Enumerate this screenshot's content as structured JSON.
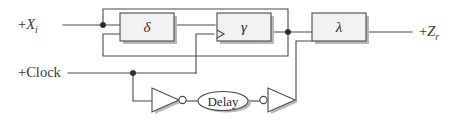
{
  "diagram": {
    "type": "block-diagram",
    "ports": [
      {
        "id": "input",
        "label_sign": "+",
        "label_symbol": "X",
        "label_subscript": "i",
        "position": "left"
      },
      {
        "id": "clock",
        "label": "+Clock",
        "position": "left-lower"
      },
      {
        "id": "output",
        "label_sign": "+",
        "label_symbol": "Z",
        "label_subscript": "r",
        "position": "right"
      }
    ],
    "blocks": [
      {
        "id": "delta-block",
        "label": "δ",
        "name": "delta"
      },
      {
        "id": "gamma-block",
        "label": "γ",
        "name": "gamma",
        "clocked": true
      },
      {
        "id": "lambda-block",
        "label": "λ",
        "name": "lambda"
      }
    ],
    "gates": [
      {
        "id": "inverter-1",
        "type": "inverter",
        "bubble": "output"
      },
      {
        "id": "inverter-2",
        "type": "inverter",
        "bubble": "input"
      }
    ],
    "delay_element": {
      "id": "delay-ellipse",
      "label": "Delay"
    },
    "junctions": [
      {
        "id": "input-junction",
        "x": 103,
        "y": 25
      },
      {
        "id": "gamma-output-junction",
        "x": 288,
        "y": 32
      },
      {
        "id": "clock-junction",
        "x": 133,
        "y": 73
      }
    ],
    "colors": {
      "wire": "#4a4a4a",
      "box_fill": "#f2f2f2",
      "box_stroke": "#4a4a4a",
      "shadow": "#b8b8b8",
      "text": "#2b2b2b",
      "background": "#ffffff"
    }
  }
}
